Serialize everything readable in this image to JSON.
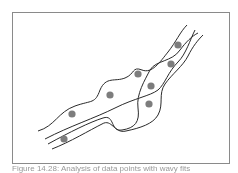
{
  "figure": {
    "frame": {
      "x": 12,
      "y": 12,
      "width": 217,
      "height": 151,
      "stroke": "#8a8a8a"
    },
    "curve_color": "#2a2a2a",
    "point_color": "#7d7d7d",
    "points": [
      {
        "x": 178,
        "y": 45
      },
      {
        "x": 171,
        "y": 64
      },
      {
        "x": 138,
        "y": 74
      },
      {
        "x": 151,
        "y": 86
      },
      {
        "x": 110,
        "y": 95
      },
      {
        "x": 149,
        "y": 104
      },
      {
        "x": 72,
        "y": 114
      },
      {
        "x": 64,
        "y": 139
      }
    ],
    "curves": [
      "M38,131 C55,126 58,112 75,106 C92,100 95,104 100,90 C106,76 115,82 125,78 C135,74 132,66 142,70 C152,74 160,62 168,52 C176,42 180,32 187,25",
      "M45,139 C70,126 95,118 115,108 C135,98 150,96 158,90 C165,84 168,72 178,62 C186,54 190,40 195,30",
      "M48,144 C70,132 90,122 103,118 C115,114 110,132 122,130 C135,128 140,122 138,108 C136,94 145,80 150,70 C156,60 172,62 180,50 C186,42 192,36 198,33",
      "M52,149 C70,142 90,130 102,124 C112,118 114,134 126,131 C140,128 153,124 158,115 C164,104 158,94 165,84 C172,74 183,66 188,56 C193,46 198,40 203,35"
    ],
    "caption": "Figure 14.28: Analysis of data points with wavy fits"
  }
}
